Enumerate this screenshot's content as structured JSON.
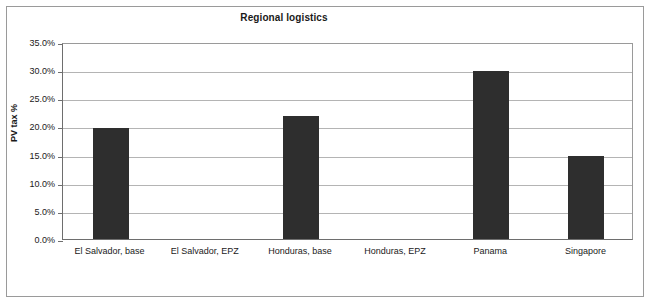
{
  "chart_data": {
    "type": "bar",
    "title": "Regional logistics",
    "xlabel": "",
    "ylabel": "PV tax %",
    "categories": [
      "El Salvador, base",
      "El Salvador, EPZ",
      "Honduras, base",
      "Honduras, EPZ",
      "Panama",
      "Singapore"
    ],
    "values": [
      0.198,
      0.0,
      0.219,
      0.0,
      0.299,
      0.147
    ],
    "value_labels": [
      "19.8%",
      "0.0%",
      "21.9%",
      "0.0%",
      "29.9%",
      "14.7%"
    ],
    "ylim": [
      0.0,
      0.35
    ],
    "ytick_values": [
      0.0,
      0.05,
      0.1,
      0.15,
      0.2,
      0.25,
      0.3,
      0.35
    ],
    "ytick_labels": [
      "0.0%",
      "5.0%",
      "10.0%",
      "15.0%",
      "20.0%",
      "25.0%",
      "30.0%",
      "35.0%"
    ],
    "grid": true,
    "legend": false,
    "legend_position": "none",
    "bar_color": "#2e2e2e",
    "gridline_color": "#b4b4b4",
    "axis_color": "#6e6e6e",
    "frame_color": "#9a9a9a",
    "background_color": "#ffffff",
    "text_color": "#1a1a1a"
  }
}
